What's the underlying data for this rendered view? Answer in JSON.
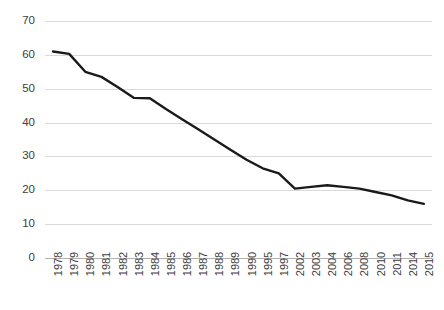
{
  "chart_data": {
    "type": "line",
    "title": "",
    "xlabel": "",
    "ylabel": "",
    "ylim": [
      0,
      70
    ],
    "y_ticks": [
      0,
      10,
      20,
      30,
      40,
      50,
      60,
      70
    ],
    "grid": true,
    "legend": "none",
    "line_color": "#1a1a1a",
    "grid_color": "#d9d9d9",
    "axis_color": "#b0b0b0",
    "text_color": "#404040",
    "categories": [
      "1978",
      "1979",
      "1980",
      "1981",
      "1982",
      "1983",
      "1984",
      "1985",
      "1986",
      "1987",
      "1988",
      "1989",
      "1990",
      "1995",
      "1997",
      "2002",
      "2003",
      "2004",
      "2006",
      "2008",
      "2010",
      "2011",
      "2014",
      "2015"
    ],
    "values": [
      61,
      60.3,
      55,
      53.5,
      50.5,
      47.3,
      47.2,
      44,
      41,
      38,
      35,
      32,
      29,
      26.5,
      25,
      20.5,
      21,
      21.5,
      21,
      20.5,
      19.5,
      18.5,
      17,
      16
    ]
  }
}
